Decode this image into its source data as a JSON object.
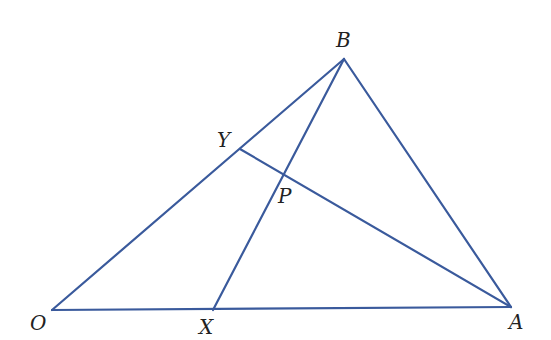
{
  "diagram": {
    "type": "geometry",
    "line_color": "#3a5a9c",
    "points": {
      "O": {
        "label": "O",
        "x": 52,
        "y": 310
      },
      "X": {
        "label": "X",
        "x": 213,
        "y": 310
      },
      "A": {
        "label": "A",
        "x": 511,
        "y": 307
      },
      "B": {
        "label": "B",
        "x": 344,
        "y": 59
      },
      "Y": {
        "label": "Y",
        "x": 240,
        "y": 149
      },
      "P": {
        "label": "P",
        "x": 285,
        "y": 176
      }
    },
    "segments": [
      {
        "from": "O",
        "to": "A"
      },
      {
        "from": "O",
        "to": "B"
      },
      {
        "from": "B",
        "to": "A"
      },
      {
        "from": "X",
        "to": "B"
      },
      {
        "from": "Y",
        "to": "A"
      }
    ]
  }
}
